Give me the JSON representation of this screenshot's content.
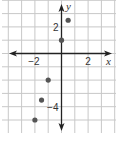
{
  "chart_data": {
    "type": "scatter",
    "title": "",
    "xlabel": "x",
    "ylabel": "y",
    "xlim": [
      -4,
      4
    ],
    "ylim": [
      -6,
      4
    ],
    "grid": true,
    "x_tick_labels": [
      "−2",
      "2"
    ],
    "x_ticks": [
      -2,
      2
    ],
    "y_tick_labels": [
      "2",
      "−4"
    ],
    "y_ticks": [
      2,
      -4
    ],
    "series": [
      {
        "name": "points",
        "points": [
          {
            "x": -2,
            "y": -5
          },
          {
            "x": -1.5,
            "y": -3.5
          },
          {
            "x": -1,
            "y": -2
          },
          {
            "x": 0,
            "y": 1
          },
          {
            "x": 0.5,
            "y": 2.5
          }
        ]
      }
    ],
    "colors": {
      "point": "#555555",
      "axis": "#222222",
      "grid": "#c8c8c8"
    }
  }
}
